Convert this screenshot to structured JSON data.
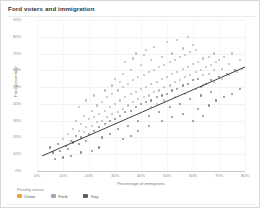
{
  "title": "Ford voters and immigration",
  "chart_data": {
    "type": "scatter",
    "title": "Ford voters and immigration",
    "xlabel": "Percentage of immigrants",
    "ylabel": "Ford percentage",
    "xlim": [
      0,
      80
    ],
    "ylim": [
      0,
      90
    ],
    "xticks": [
      "0%",
      "10%",
      "20%",
      "30%",
      "40%",
      "50%",
      "60%",
      "70%",
      "80%"
    ],
    "xtick_values": [
      0,
      10,
      20,
      30,
      40,
      50,
      60,
      70,
      80
    ],
    "yticks": [
      "0%",
      "10%",
      "20%",
      "30%",
      "40%",
      "50%",
      "60%",
      "70%",
      "80%",
      "90%"
    ],
    "ytick_values": [
      0,
      10,
      20,
      30,
      40,
      50,
      60,
      70,
      80,
      90
    ],
    "grid": true,
    "legend_position": "bottom-left",
    "legend_title": "Plurality winner",
    "series": [
      {
        "name": "Chow",
        "color": "#e8a33d",
        "marker": "circle"
      },
      {
        "name": "Ford",
        "color": "#9aa7b4",
        "marker": "circle"
      },
      {
        "name": "Tory",
        "color": "#5a5f66",
        "marker": "circle"
      }
    ],
    "trendline": {
      "x0": 2,
      "y0": 9,
      "x1": 80,
      "y1": 62,
      "color": "#2b2b2b"
    },
    "points": [
      {
        "x": 5,
        "y": 14,
        "g": 2
      },
      {
        "x": 6,
        "y": 11,
        "g": 2
      },
      {
        "x": 8,
        "y": 16,
        "g": 2
      },
      {
        "x": 9,
        "y": 12,
        "g": 2
      },
      {
        "x": 10,
        "y": 19,
        "g": 1
      },
      {
        "x": 11,
        "y": 15,
        "g": 2
      },
      {
        "x": 12,
        "y": 22,
        "g": 1
      },
      {
        "x": 12,
        "y": 13,
        "g": 2
      },
      {
        "x": 13,
        "y": 18,
        "g": 2
      },
      {
        "x": 14,
        "y": 25,
        "g": 1
      },
      {
        "x": 14,
        "y": 17,
        "g": 2
      },
      {
        "x": 15,
        "y": 21,
        "g": 2
      },
      {
        "x": 15,
        "y": 30,
        "g": 1
      },
      {
        "x": 16,
        "y": 16,
        "g": 2
      },
      {
        "x": 16,
        "y": 24,
        "g": 1
      },
      {
        "x": 17,
        "y": 28,
        "g": 1
      },
      {
        "x": 17,
        "y": 20,
        "g": 2
      },
      {
        "x": 18,
        "y": 23,
        "g": 1
      },
      {
        "x": 18,
        "y": 33,
        "g": 1
      },
      {
        "x": 19,
        "y": 26,
        "g": 1
      },
      {
        "x": 19,
        "y": 18,
        "g": 2
      },
      {
        "x": 20,
        "y": 31,
        "g": 1
      },
      {
        "x": 20,
        "y": 22,
        "g": 2
      },
      {
        "x": 21,
        "y": 27,
        "g": 1
      },
      {
        "x": 21,
        "y": 36,
        "g": 1
      },
      {
        "x": 22,
        "y": 24,
        "g": 2
      },
      {
        "x": 22,
        "y": 32,
        "g": 1
      },
      {
        "x": 23,
        "y": 29,
        "g": 1
      },
      {
        "x": 23,
        "y": 39,
        "g": 1
      },
      {
        "x": 24,
        "y": 26,
        "g": 2
      },
      {
        "x": 24,
        "y": 34,
        "g": 1
      },
      {
        "x": 25,
        "y": 30,
        "g": 1
      },
      {
        "x": 25,
        "y": 41,
        "g": 1
      },
      {
        "x": 26,
        "y": 28,
        "g": 2
      },
      {
        "x": 26,
        "y": 36,
        "g": 1
      },
      {
        "x": 27,
        "y": 32,
        "g": 1
      },
      {
        "x": 27,
        "y": 44,
        "g": 1
      },
      {
        "x": 28,
        "y": 30,
        "g": 2
      },
      {
        "x": 28,
        "y": 38,
        "g": 1
      },
      {
        "x": 29,
        "y": 34,
        "g": 1
      },
      {
        "x": 29,
        "y": 46,
        "g": 1
      },
      {
        "x": 30,
        "y": 31,
        "g": 2
      },
      {
        "x": 30,
        "y": 40,
        "g": 1
      },
      {
        "x": 31,
        "y": 35,
        "g": 1
      },
      {
        "x": 31,
        "y": 48,
        "g": 1
      },
      {
        "x": 32,
        "y": 33,
        "g": 2
      },
      {
        "x": 32,
        "y": 42,
        "g": 1
      },
      {
        "x": 33,
        "y": 37,
        "g": 1
      },
      {
        "x": 33,
        "y": 50,
        "g": 1
      },
      {
        "x": 34,
        "y": 35,
        "g": 2
      },
      {
        "x": 34,
        "y": 44,
        "g": 1
      },
      {
        "x": 35,
        "y": 39,
        "g": 1
      },
      {
        "x": 35,
        "y": 52,
        "g": 1
      },
      {
        "x": 36,
        "y": 36,
        "g": 2
      },
      {
        "x": 36,
        "y": 46,
        "g": 1
      },
      {
        "x": 37,
        "y": 41,
        "g": 1
      },
      {
        "x": 37,
        "y": 54,
        "g": 1
      },
      {
        "x": 38,
        "y": 38,
        "g": 2
      },
      {
        "x": 38,
        "y": 47,
        "g": 1
      },
      {
        "x": 39,
        "y": 43,
        "g": 1
      },
      {
        "x": 39,
        "y": 56,
        "g": 1
      },
      {
        "x": 40,
        "y": 40,
        "g": 2
      },
      {
        "x": 40,
        "y": 49,
        "g": 1
      },
      {
        "x": 41,
        "y": 44,
        "g": 1
      },
      {
        "x": 41,
        "y": 57,
        "g": 1
      },
      {
        "x": 42,
        "y": 41,
        "g": 2
      },
      {
        "x": 42,
        "y": 50,
        "g": 1
      },
      {
        "x": 43,
        "y": 45,
        "g": 1
      },
      {
        "x": 43,
        "y": 59,
        "g": 1
      },
      {
        "x": 44,
        "y": 42,
        "g": 2
      },
      {
        "x": 44,
        "y": 52,
        "g": 1
      },
      {
        "x": 45,
        "y": 47,
        "g": 1
      },
      {
        "x": 45,
        "y": 60,
        "g": 1
      },
      {
        "x": 46,
        "y": 44,
        "g": 2
      },
      {
        "x": 46,
        "y": 53,
        "g": 1
      },
      {
        "x": 47,
        "y": 48,
        "g": 1
      },
      {
        "x": 47,
        "y": 62,
        "g": 1
      },
      {
        "x": 48,
        "y": 45,
        "g": 2
      },
      {
        "x": 48,
        "y": 55,
        "g": 1
      },
      {
        "x": 49,
        "y": 50,
        "g": 1
      },
      {
        "x": 49,
        "y": 63,
        "g": 1
      },
      {
        "x": 50,
        "y": 46,
        "g": 2
      },
      {
        "x": 50,
        "y": 56,
        "g": 1
      },
      {
        "x": 51,
        "y": 51,
        "g": 1
      },
      {
        "x": 51,
        "y": 65,
        "g": 1
      },
      {
        "x": 52,
        "y": 48,
        "g": 2
      },
      {
        "x": 52,
        "y": 58,
        "g": 1
      },
      {
        "x": 53,
        "y": 53,
        "g": 1
      },
      {
        "x": 53,
        "y": 66,
        "g": 1
      },
      {
        "x": 54,
        "y": 49,
        "g": 2
      },
      {
        "x": 54,
        "y": 59,
        "g": 1
      },
      {
        "x": 55,
        "y": 54,
        "g": 1
      },
      {
        "x": 55,
        "y": 68,
        "g": 1
      },
      {
        "x": 56,
        "y": 51,
        "g": 2
      },
      {
        "x": 56,
        "y": 61,
        "g": 1
      },
      {
        "x": 57,
        "y": 56,
        "g": 1
      },
      {
        "x": 57,
        "y": 69,
        "g": 1
      },
      {
        "x": 58,
        "y": 52,
        "g": 2
      },
      {
        "x": 58,
        "y": 62,
        "g": 1
      },
      {
        "x": 59,
        "y": 57,
        "g": 1
      },
      {
        "x": 59,
        "y": 71,
        "g": 1
      },
      {
        "x": 60,
        "y": 54,
        "g": 2
      },
      {
        "x": 60,
        "y": 64,
        "g": 1
      },
      {
        "x": 61,
        "y": 59,
        "g": 1
      },
      {
        "x": 61,
        "y": 72,
        "g": 1
      },
      {
        "x": 62,
        "y": 55,
        "g": 2
      },
      {
        "x": 62,
        "y": 65,
        "g": 1
      },
      {
        "x": 63,
        "y": 60,
        "g": 1
      },
      {
        "x": 63,
        "y": 50,
        "g": 2
      },
      {
        "x": 64,
        "y": 57,
        "g": 1
      },
      {
        "x": 64,
        "y": 67,
        "g": 1
      },
      {
        "x": 65,
        "y": 62,
        "g": 1
      },
      {
        "x": 65,
        "y": 52,
        "g": 2
      },
      {
        "x": 66,
        "y": 58,
        "g": 1
      },
      {
        "x": 66,
        "y": 68,
        "g": 1
      },
      {
        "x": 67,
        "y": 63,
        "g": 1
      },
      {
        "x": 67,
        "y": 54,
        "g": 2
      },
      {
        "x": 68,
        "y": 60,
        "g": 1
      },
      {
        "x": 68,
        "y": 70,
        "g": 1
      },
      {
        "x": 69,
        "y": 65,
        "g": 1
      },
      {
        "x": 70,
        "y": 56,
        "g": 2
      },
      {
        "x": 70,
        "y": 66,
        "g": 1
      },
      {
        "x": 71,
        "y": 61,
        "g": 1
      },
      {
        "x": 72,
        "y": 68,
        "g": 1
      },
      {
        "x": 73,
        "y": 58,
        "g": 2
      },
      {
        "x": 74,
        "y": 64,
        "g": 1
      },
      {
        "x": 75,
        "y": 70,
        "g": 1
      },
      {
        "x": 76,
        "y": 60,
        "g": 2
      },
      {
        "x": 78,
        "y": 66,
        "g": 1
      },
      {
        "x": 30,
        "y": 55,
        "g": 1
      },
      {
        "x": 33,
        "y": 58,
        "g": 1
      },
      {
        "x": 36,
        "y": 60,
        "g": 1
      },
      {
        "x": 40,
        "y": 63,
        "g": 1
      },
      {
        "x": 44,
        "y": 66,
        "g": 1
      },
      {
        "x": 48,
        "y": 68,
        "g": 1
      },
      {
        "x": 52,
        "y": 70,
        "g": 1
      },
      {
        "x": 56,
        "y": 73,
        "g": 1
      },
      {
        "x": 60,
        "y": 75,
        "g": 1
      },
      {
        "x": 25,
        "y": 20,
        "g": 2
      },
      {
        "x": 28,
        "y": 22,
        "g": 2
      },
      {
        "x": 31,
        "y": 25,
        "g": 2
      },
      {
        "x": 35,
        "y": 27,
        "g": 2
      },
      {
        "x": 39,
        "y": 30,
        "g": 2
      },
      {
        "x": 43,
        "y": 33,
        "g": 2
      },
      {
        "x": 47,
        "y": 35,
        "g": 2
      },
      {
        "x": 51,
        "y": 38,
        "g": 2
      },
      {
        "x": 55,
        "y": 40,
        "g": 2
      },
      {
        "x": 59,
        "y": 43,
        "g": 2
      },
      {
        "x": 63,
        "y": 45,
        "g": 2
      },
      {
        "x": 67,
        "y": 47,
        "g": 2
      },
      {
        "x": 45,
        "y": 74,
        "g": 1
      },
      {
        "x": 50,
        "y": 77,
        "g": 1
      },
      {
        "x": 38,
        "y": 70,
        "g": 1
      },
      {
        "x": 42,
        "y": 72,
        "g": 1
      },
      {
        "x": 54,
        "y": 78,
        "g": 1
      },
      {
        "x": 58,
        "y": 80,
        "g": 1
      },
      {
        "x": 21,
        "y": 12,
        "g": 2
      },
      {
        "x": 24,
        "y": 14,
        "g": 2
      },
      {
        "x": 17,
        "y": 11,
        "g": 2
      },
      {
        "x": 13,
        "y": 9,
        "g": 2
      },
      {
        "x": 10,
        "y": 8,
        "g": 2
      },
      {
        "x": 7,
        "y": 7,
        "g": 2
      },
      {
        "x": 44,
        "y": 38,
        "g": 1
      },
      {
        "x": 46,
        "y": 40,
        "g": 1
      },
      {
        "x": 49,
        "y": 42,
        "g": 1
      },
      {
        "x": 53,
        "y": 44,
        "g": 1
      },
      {
        "x": 57,
        "y": 46,
        "g": 1
      },
      {
        "x": 61,
        "y": 49,
        "g": 1
      },
      {
        "x": 64,
        "y": 51,
        "g": 1
      },
      {
        "x": 68,
        "y": 53,
        "g": 1
      },
      {
        "x": 71,
        "y": 55,
        "g": 1
      },
      {
        "x": 74,
        "y": 57,
        "g": 1
      },
      {
        "x": 77,
        "y": 59,
        "g": 1
      },
      {
        "x": 79,
        "y": 61,
        "g": 1
      },
      {
        "x": 34,
        "y": 65,
        "g": 1
      },
      {
        "x": 37,
        "y": 67,
        "g": 1
      },
      {
        "x": 41,
        "y": 69,
        "g": 1
      },
      {
        "x": 26,
        "y": 48,
        "g": 1
      },
      {
        "x": 29,
        "y": 51,
        "g": 1
      },
      {
        "x": 32,
        "y": 53,
        "g": 1
      },
      {
        "x": 62,
        "y": 37,
        "g": 2
      },
      {
        "x": 66,
        "y": 39,
        "g": 2
      },
      {
        "x": 69,
        "y": 42,
        "g": 2
      },
      {
        "x": 72,
        "y": 44,
        "g": 2
      },
      {
        "x": 75,
        "y": 46,
        "g": 2
      },
      {
        "x": 78,
        "y": 49,
        "g": 2
      },
      {
        "x": 19,
        "y": 42,
        "g": 1
      },
      {
        "x": 22,
        "y": 45,
        "g": 1
      },
      {
        "x": 16,
        "y": 38,
        "g": 1
      },
      {
        "x": 48,
        "y": 30,
        "g": 2
      },
      {
        "x": 52,
        "y": 32,
        "g": 2
      },
      {
        "x": 56,
        "y": 34,
        "g": 2
      },
      {
        "x": 60,
        "y": 30,
        "g": 2
      },
      {
        "x": 64,
        "y": 33,
        "g": 2
      },
      {
        "x": 43,
        "y": 27,
        "g": 2
      },
      {
        "x": 39,
        "y": 24,
        "g": 2
      },
      {
        "x": 36,
        "y": 21,
        "g": 2
      },
      {
        "x": 33,
        "y": 19,
        "g": 2
      }
    ]
  },
  "legend": {
    "title": "Plurality winner",
    "items": [
      {
        "label": "Chow",
        "color": "#e8a33d"
      },
      {
        "label": "Ford",
        "color": "#9aa7b4"
      },
      {
        "label": "Tory",
        "color": "#5a5f66"
      }
    ]
  }
}
